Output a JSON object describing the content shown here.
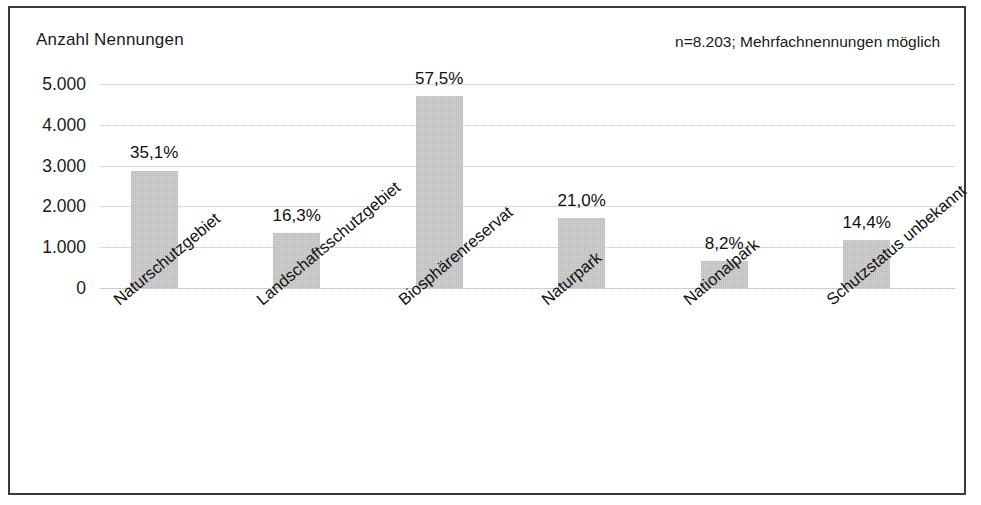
{
  "chart_data": {
    "type": "bar",
    "title": "",
    "subtitle": "",
    "axis_title": "Anzahl Nennungen",
    "annotation": "n=8.203; Mehrfachnennungen möglich",
    "xlabel": "",
    "ylabel": "Anzahl Nennungen",
    "ylim": [
      0,
      5000
    ],
    "ytick_labels": [
      "5.000",
      "4.000",
      "3.000",
      "2.000",
      "1.000",
      "0"
    ],
    "ytick_values": [
      5000,
      4000,
      3000,
      2000,
      1000,
      0
    ],
    "grid": true,
    "legend": "none",
    "bar_color": "#cdcdcd",
    "categories": [
      "Naturschutzgebiet",
      "Landschaftsschutzgebiet",
      "Biosphärenreservat",
      "Naturpark",
      "Nationalpark",
      "Schutzstatus unbekannt"
    ],
    "values": [
      2880,
      1337,
      4717,
      1723,
      673,
      1181
    ],
    "data_labels": [
      "35,1%",
      "16,3%",
      "57,5%",
      "21,0%",
      "8,2%",
      "14,4%"
    ],
    "percent_values": [
      35.1,
      16.3,
      57.5,
      21.0,
      8.2,
      14.4
    ]
  }
}
